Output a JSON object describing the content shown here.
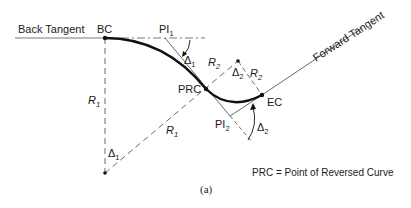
{
  "labels": {
    "back_tangent": "Back Tangent",
    "forward_tangent": "Forward Tangent",
    "bc": "BC",
    "pi": "PI",
    "pi1_sub": "1",
    "pi2_sub": "2",
    "prc": "PRC",
    "ec": "EC",
    "r": "R",
    "r1_sub": "1",
    "r2_sub": "2",
    "delta": "Δ",
    "delta1_sub": "1",
    "delta2_sub": "2",
    "legend": "PRC = Point of Reversed Curve",
    "caption": "(a)"
  },
  "colors": {
    "line": "#1a1a1a",
    "background": "#ffffff"
  }
}
